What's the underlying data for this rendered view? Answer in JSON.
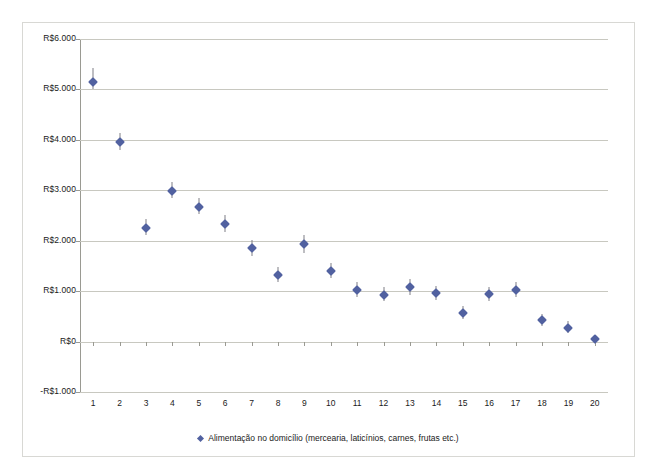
{
  "chart_data": {
    "type": "scatter",
    "title": "",
    "xlabel": "",
    "ylabel": "",
    "grid": true,
    "legend_position": "bottom",
    "legend": [
      "Alimentação no domicílio (mercearia, laticínios, carnes, frutas etc.)"
    ],
    "categories": [
      "1",
      "2",
      "3",
      "4",
      "5",
      "6",
      "7",
      "8",
      "9",
      "10",
      "11",
      "12",
      "13",
      "14",
      "15",
      "16",
      "17",
      "18",
      "19",
      "20"
    ],
    "ylim": [
      -1000,
      6000
    ],
    "ytick_values": [
      6000,
      5000,
      4000,
      3000,
      2000,
      1000,
      0,
      -1000
    ],
    "ytick_labels": [
      "R$6.000",
      "R$5.000",
      "R$4.000",
      "R$3.000",
      "R$2.000",
      "R$1.000",
      "R$0",
      "-R$1.000"
    ],
    "series": [
      {
        "name": "Alimentação no domicílio (mercearia, laticínios, carnes, frutas etc.)",
        "marker": "diamond",
        "color": "#5161a0",
        "errorbar_color": "#7e7e86",
        "values": [
          5150,
          3960,
          2250,
          2990,
          2670,
          2330,
          1850,
          1330,
          1930,
          1400,
          1020,
          930,
          1080,
          960,
          570,
          940,
          1030,
          420,
          270,
          60
        ],
        "error_low": [
          5000,
          3800,
          2120,
          2840,
          2520,
          2180,
          1700,
          1190,
          1760,
          1260,
          880,
          800,
          930,
          830,
          440,
          800,
          890,
          300,
          160,
          0
        ],
        "error_high": [
          5430,
          4140,
          2430,
          3160,
          2840,
          2510,
          2020,
          1480,
          2120,
          1560,
          1180,
          1080,
          1250,
          1110,
          710,
          1090,
          1190,
          550,
          400,
          130
        ]
      }
    ]
  },
  "legend": {
    "marker_name": "diamond-marker",
    "label": "Alimentação no domicílio (mercearia, laticínios, carnes, frutas etc.)"
  },
  "colors": {
    "marker": "#5161a0",
    "errorbar": "#7e7e86",
    "gridline": "#c8c8c0",
    "axis": "#9a9a92",
    "frame": "#d8d8d4",
    "text": "#1a1a1a"
  }
}
